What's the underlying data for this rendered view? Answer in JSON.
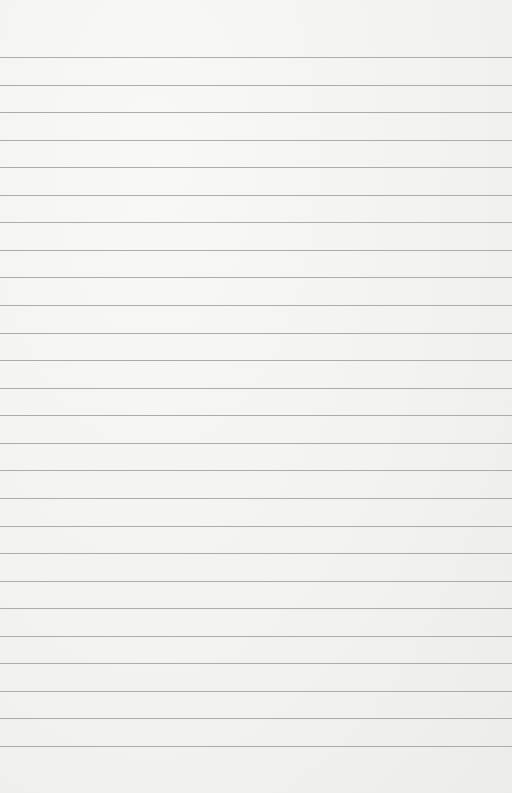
{
  "paper": {
    "width": 512,
    "height": 793,
    "background": "#f4f4f3",
    "line_color": "#9a9a9a",
    "first_line_y": 57,
    "line_spacing": 27.56,
    "line_count": 26
  }
}
